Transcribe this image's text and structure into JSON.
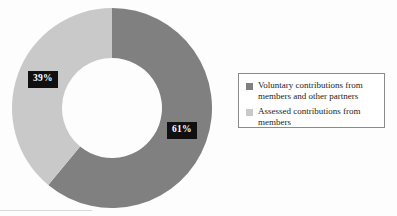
{
  "chart_data": {
    "type": "pie",
    "variant": "donut",
    "title": "",
    "subtitle": "",
    "xlabel": "",
    "ylabel": "",
    "units": "%",
    "grid": false,
    "legend_position": "right",
    "start_angle_deg": 0,
    "direction": "clockwise",
    "inner_radius_ratio": 0.5,
    "categories": [
      "Voluntary contributions from members and other partners",
      "Assessed contributions from members"
    ],
    "values": [
      61,
      39
    ],
    "data_labels": [
      "61%",
      "39%"
    ],
    "colors": [
      "#808080",
      "#c9c9c9"
    ],
    "series": [
      {
        "name": "Share of funding",
        "values": [
          61,
          39
        ]
      }
    ]
  },
  "labels": {
    "voluntary_pct": "61%",
    "assessed_pct": "39%"
  },
  "legend": {
    "items": [
      {
        "label": "Voluntary contributions from members and other partners",
        "color": "#808080"
      },
      {
        "label": "Assessed contributions from members",
        "color": "#c9c9c9"
      }
    ]
  },
  "colors": {
    "voluntary": "#808080",
    "assessed": "#c9c9c9",
    "label_background": "#101010",
    "label_text": "#ffffff",
    "legend_border": "#8a8a8a",
    "background": "#fdfdfd"
  }
}
